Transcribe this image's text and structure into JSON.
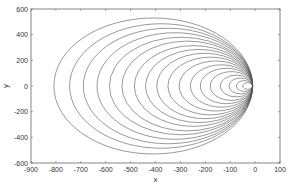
{
  "chart_data": {
    "type": "line",
    "title": "",
    "xlabel": "x",
    "ylabel": "y",
    "xlim": [
      -900,
      100
    ],
    "ylim": [
      -600,
      600
    ],
    "xticks": [
      -900,
      -800,
      -700,
      -600,
      -500,
      -400,
      -300,
      -200,
      -100,
      0,
      100
    ],
    "yticks": [
      -600,
      -400,
      -200,
      0,
      200,
      400,
      600
    ],
    "xtick_labels": [
      "-900",
      "-800",
      "-700",
      "-600",
      "-500",
      "-400",
      "-300",
      "-200",
      "-100",
      "0",
      "100"
    ],
    "ytick_labels": [
      "-600",
      "-400",
      "-200",
      "0",
      "200",
      "400",
      "600"
    ],
    "grid": false,
    "legend": null,
    "line_color": "#555555",
    "series": [
      {
        "name": "curve-1",
        "left_x": -808,
        "right_x": -10,
        "half_height": 530
      },
      {
        "name": "curve-2",
        "left_x": -745,
        "right_x": -10,
        "half_height": 485
      },
      {
        "name": "curve-3",
        "left_x": -690,
        "right_x": -10,
        "half_height": 450
      },
      {
        "name": "curve-4",
        "left_x": -635,
        "right_x": -10,
        "half_height": 415
      },
      {
        "name": "curve-5",
        "left_x": -585,
        "right_x": -10,
        "half_height": 380
      },
      {
        "name": "curve-6",
        "left_x": -535,
        "right_x": -10,
        "half_height": 350
      },
      {
        "name": "curve-7",
        "left_x": -485,
        "right_x": -10,
        "half_height": 315
      },
      {
        "name": "curve-8",
        "left_x": -440,
        "right_x": -10,
        "half_height": 285
      },
      {
        "name": "curve-9",
        "left_x": -395,
        "right_x": -10,
        "half_height": 255
      },
      {
        "name": "curve-10",
        "left_x": -350,
        "right_x": -10,
        "half_height": 225
      },
      {
        "name": "curve-11",
        "left_x": -305,
        "right_x": -10,
        "half_height": 195
      },
      {
        "name": "curve-12",
        "left_x": -260,
        "right_x": -10,
        "half_height": 165
      },
      {
        "name": "curve-13",
        "left_x": -220,
        "right_x": -10,
        "half_height": 138
      },
      {
        "name": "curve-14",
        "left_x": -180,
        "right_x": -10,
        "half_height": 112
      },
      {
        "name": "curve-15",
        "left_x": -140,
        "right_x": -10,
        "half_height": 85
      },
      {
        "name": "curve-16",
        "left_x": -105,
        "right_x": -10,
        "half_height": 62
      },
      {
        "name": "curve-17",
        "left_x": -75,
        "right_x": -10,
        "half_height": 42
      },
      {
        "name": "curve-18",
        "left_x": -50,
        "right_x": -10,
        "half_height": 26
      }
    ]
  }
}
